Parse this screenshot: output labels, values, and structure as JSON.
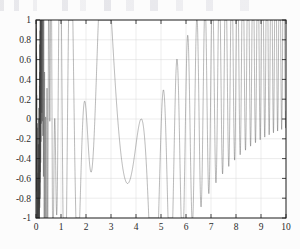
{
  "figure": {
    "title": "",
    "background_color": "#fcfcfc",
    "frame_color": "#1a1a1a",
    "grid_color": "#d8d8d8",
    "curve_color": "#3a3a3a"
  },
  "axes": {
    "x_tick_labels": [
      "0",
      "1",
      "2",
      "3",
      "4",
      "5",
      "6",
      "7",
      "8",
      "9",
      "10"
    ],
    "y_tick_labels": [
      "1",
      "0.8",
      "0.6",
      "0.4",
      "0.2",
      "0",
      "-0.2",
      "-0.4",
      "-0.6",
      "-0.8",
      "-1"
    ],
    "x_axis_label": "",
    "y_axis_label": ""
  },
  "chart_data": {
    "type": "line",
    "title": "",
    "xlabel": "",
    "ylabel": "",
    "xlim": [
      0,
      10
    ],
    "ylim": [
      -1,
      1
    ],
    "xticks": [
      0,
      1,
      2,
      3,
      4,
      5,
      6,
      7,
      8,
      9,
      10
    ],
    "yticks": [
      1,
      0.8,
      0.6,
      0.4,
      0.2,
      0,
      -0.2,
      -0.4,
      -0.6,
      -0.8,
      -1
    ],
    "grid": true,
    "legend": null,
    "series": [
      {
        "name": "y",
        "formula": "sin(20/x) + sin(3.1*(x-3.5)^2)",
        "sample_count": 4000,
        "y_min": -1,
        "y_max": 1,
        "features": [
          {
            "x": 0.0,
            "note": "frequency singularity, unresolved dense band"
          },
          {
            "x": 3.5,
            "note": "lowest frequency, smooth local minimum near y = 0.5"
          },
          {
            "x": 3.7,
            "note": "broad flat trough touching y = -1"
          },
          {
            "x": 8.0,
            "note": "oscillation merges into solid shaded band"
          },
          {
            "x": 10.0,
            "note": "maximum frequency at right edge"
          }
        ]
      }
    ]
  }
}
